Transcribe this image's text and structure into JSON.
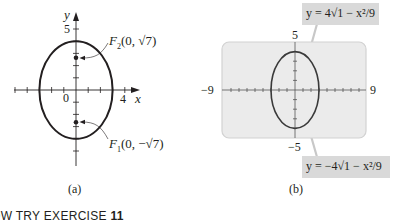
{
  "figure_a": {
    "caption": "(a)",
    "x_axis_label": "x",
    "y_axis_label": "y",
    "x_tick_label": "4",
    "y_tick_label": "5",
    "origin_label": "0",
    "ellipse": {
      "a_x": 3,
      "b_y": 4,
      "center": [
        0,
        0
      ]
    },
    "foci": [
      {
        "name": "F2",
        "label_main": "F",
        "label_sub": "2",
        "label_coords": "(0, √7)",
        "y": 2.6458
      },
      {
        "name": "F1",
        "label_main": "F",
        "label_sub": "1",
        "label_coords": "(0, −√7)",
        "y": -2.6458
      }
    ]
  },
  "figure_b": {
    "caption": "(b)",
    "window": {
      "xmin": -9,
      "xmax": 9,
      "ymin": -5,
      "ymax": 5
    },
    "xmin_label": "−9",
    "xmax_label": "9",
    "ymax_label": "5",
    "ymin_label": "−5",
    "upper_equation": "y = 4√1 − x²/9",
    "lower_equation": "y = −4√1 − x²/9",
    "colors": {
      "screen_fill": "#ebebeb",
      "screen_border": "#d2d2d2",
      "label_fill": "#d9d9d9",
      "curve": "#3a3a3a"
    }
  },
  "footer": {
    "prefix": "OW TRY EXERCISE ",
    "exercise_number": "11"
  }
}
